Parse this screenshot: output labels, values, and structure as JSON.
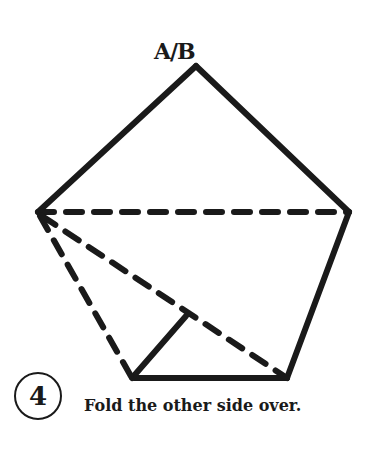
{
  "diagram": {
    "apex_label": "A/B",
    "step_number": "4",
    "instruction": "Fold the other side over.",
    "stroke_color": "#1a1a1a",
    "background": "#ffffff",
    "points": {
      "apex": [
        196,
        66
      ],
      "left": [
        38,
        212
      ],
      "right": [
        349,
        212
      ],
      "bottom_left": [
        132,
        378
      ],
      "bottom_right": [
        287,
        378
      ],
      "inner_fold": [
        186,
        316
      ]
    },
    "solid_edges": [
      "apex-left",
      "apex-right",
      "right-bottom_right",
      "bottom_left-bottom_right",
      "bottom_left-inner_fold"
    ],
    "dashed_edges": [
      "left-right",
      "left-bottom_left",
      "left-bottom_right"
    ]
  }
}
